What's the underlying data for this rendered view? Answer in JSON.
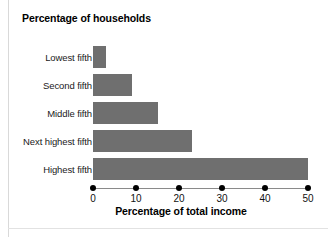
{
  "chart_data": {
    "type": "bar",
    "orientation": "horizontal",
    "title": "Percentage of households",
    "xlabel": "Percentage of total income",
    "ylabel": "Percentage of households",
    "categories": [
      "Lowest fifth",
      "Second fifth",
      "Middle fifth",
      "Next highest fifth",
      "Highest fifth"
    ],
    "values": [
      3,
      9,
      15,
      23,
      50
    ],
    "xlim": [
      0,
      50
    ],
    "xticks": [
      0,
      10,
      20,
      30,
      40,
      50
    ],
    "xtick_labels": [
      "0",
      "10",
      "20",
      "30",
      "40",
      "50"
    ],
    "grid": false,
    "legend": false,
    "bar_color": "#6f6f6f",
    "background_color": "#ffffff",
    "text_color": "#111111"
  }
}
